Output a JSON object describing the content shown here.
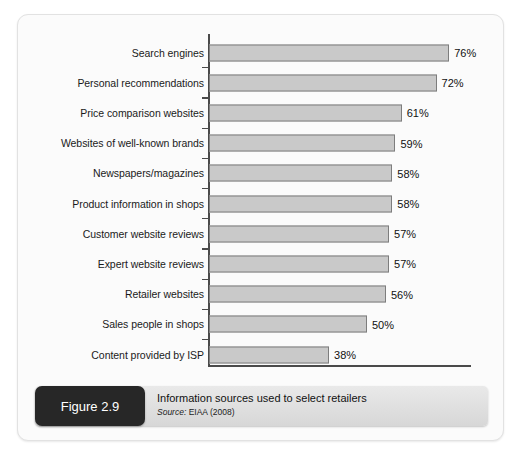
{
  "figure": {
    "badge_label": "Figure 2.9",
    "title": "Information sources used to select retailers",
    "source_label": "Source:",
    "source_value": "EIAA (2008)"
  },
  "colors": {
    "bar_fill": "#c9c9c9",
    "bar_stroke": "#7d7d7d",
    "axis": "#4a4a4a",
    "badge_bg": "#272727",
    "caption_bg": "#e1e1e1",
    "panel_bg": "#fbfbfb"
  },
  "chart_data": {
    "type": "bar",
    "orientation": "horizontal",
    "title": "Information sources used to select retailers",
    "subtitle": "Source: EIAA (2008)",
    "xlabel": "",
    "ylabel": "",
    "xlim": [
      0,
      80
    ],
    "grid": false,
    "legend": null,
    "value_suffix": "%",
    "categories": [
      "Search engines",
      "Personal recommendations",
      "Price comparison websites",
      "Websites of well-known brands",
      "Newspapers/magazines",
      "Product information in shops",
      "Customer website reviews",
      "Expert website reviews",
      "Retailer websites",
      "Sales people in shops",
      "Content provided by ISP"
    ],
    "values": [
      76,
      72,
      61,
      59,
      58,
      58,
      57,
      57,
      56,
      50,
      38
    ],
    "labels": [
      "76%",
      "72%",
      "61%",
      "59%",
      "58%",
      "58%",
      "57%",
      "57%",
      "56%",
      "50%",
      "38%"
    ]
  }
}
